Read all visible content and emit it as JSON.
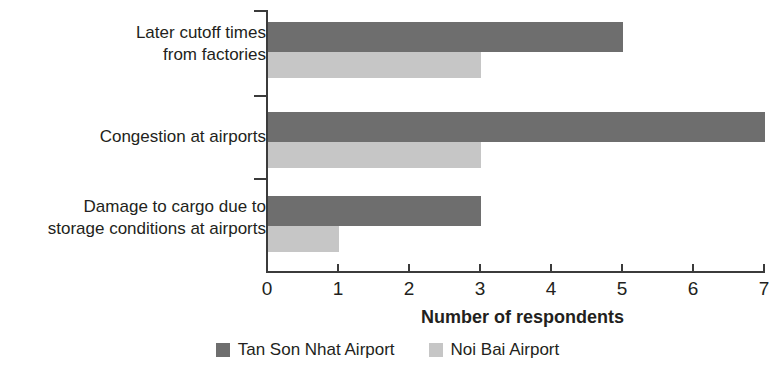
{
  "chart_data": {
    "type": "bar",
    "orientation": "horizontal",
    "title": "",
    "xlabel": "Number of respondents",
    "ylabel": "",
    "xlim": [
      0,
      7
    ],
    "xticks": [
      0,
      1,
      2,
      3,
      4,
      5,
      6,
      7
    ],
    "grid": false,
    "legend_position": "bottom",
    "categories": [
      "Later cutoff times from factories",
      "Congestion at airports",
      "Damage to cargo due to storage conditions at airports"
    ],
    "category_lines": [
      [
        "Later cutoff times",
        "from factories"
      ],
      [
        "Congestion at airports"
      ],
      [
        "Damage to cargo due to",
        "storage conditions at airports"
      ]
    ],
    "series": [
      {
        "name": "Tan Son Nhat Airport",
        "color": "#6e6e6e",
        "values": [
          5,
          7,
          3
        ]
      },
      {
        "name": "Noi Bai Airport",
        "color": "#c6c6c6",
        "values": [
          3,
          3,
          1
        ]
      }
    ]
  }
}
